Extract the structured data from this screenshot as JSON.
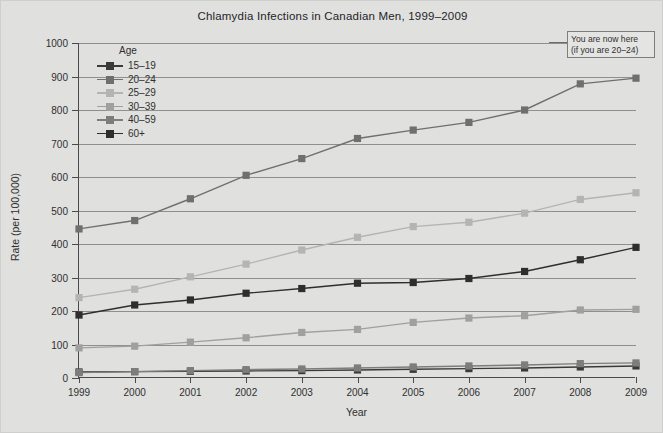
{
  "chart_data": {
    "type": "line",
    "title": "Chlamydia Infections in Canadian Men, 1999–2009",
    "xlabel": "Year",
    "ylabel": "Rate (per 100,000)",
    "categories": [
      "1999",
      "2000",
      "2001",
      "2002",
      "2003",
      "2004",
      "2005",
      "2006",
      "2007",
      "2008",
      "2009"
    ],
    "x": [
      1999,
      2000,
      2001,
      2002,
      2003,
      2004,
      2005,
      2006,
      2007,
      2008,
      2009
    ],
    "ylim": [
      0,
      1000
    ],
    "yticks": [
      0,
      100,
      200,
      300,
      400,
      500,
      600,
      700,
      800,
      900,
      1000
    ],
    "grid": true,
    "legend_position": "upper-left-inside",
    "legend_title": "Age",
    "series": [
      {
        "name": "15–19",
        "color": "#3a3a3a",
        "values": [
          18,
          19,
          20,
          21,
          22,
          24,
          26,
          28,
          30,
          33,
          36
        ]
      },
      {
        "name": "20–24",
        "color": "#6f6f6f",
        "values": [
          445,
          470,
          535,
          605,
          655,
          715,
          740,
          763,
          800,
          878,
          895
        ]
      },
      {
        "name": "25–29",
        "color": "#b4b4b4",
        "values": [
          240,
          265,
          302,
          340,
          382,
          420,
          452,
          465,
          492,
          533,
          553
        ]
      },
      {
        "name": "30–39",
        "color": "#a0a0a0",
        "values": [
          90,
          95,
          107,
          120,
          136,
          145,
          166,
          179,
          186,
          203,
          205
        ]
      },
      {
        "name": "40–59",
        "color": "#7d7d7d",
        "values": [
          16,
          19,
          22,
          25,
          27,
          30,
          33,
          36,
          39,
          43,
          45
        ]
      },
      {
        "name": "60+",
        "color": "#2e2e2e",
        "values": [
          188,
          218,
          233,
          253,
          267,
          283,
          285,
          297,
          318,
          353,
          390
        ]
      }
    ],
    "annotation": {
      "line1": "You are now here",
      "line2": "(if you are 20–24)",
      "target_series": "20–24",
      "target_x": "2009"
    }
  }
}
